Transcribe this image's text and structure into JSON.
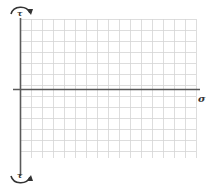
{
  "diagram": {
    "type": "stress-axes",
    "labels": {
      "top": "τ",
      "bottom": "τ",
      "right": "σ"
    },
    "grid": {
      "x_start": 20,
      "x_end": 196,
      "y_start": 19,
      "y_end": 158,
      "spacing": 11
    },
    "axes": {
      "horizontal_y": 89,
      "vertical_x": 20
    },
    "arrows": {
      "top": "clockwise-arc",
      "bottom": "counterclockwise-arc"
    },
    "colors": {
      "grid": "#d4d4d4",
      "axis": "#5a5a5a",
      "text": "#333333"
    }
  }
}
